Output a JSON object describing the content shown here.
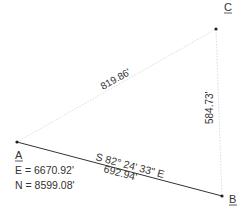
{
  "diagram": {
    "points": [
      {
        "id": "A",
        "label": "A",
        "x": 17,
        "y": 142
      },
      {
        "id": "B",
        "label": "B",
        "x": 222,
        "y": 196
      },
      {
        "id": "C",
        "label": "C",
        "x": 216,
        "y": 29
      }
    ],
    "point_a_coords": {
      "easting": "E = 6670.92'",
      "northing": "N = 8599.08'"
    },
    "lines": {
      "ab": {
        "bearing": "S 82° 24' 33\" E",
        "distance": "692.94'",
        "style": "solid"
      },
      "ac": {
        "distance": "819.86'",
        "style": "dotted"
      },
      "cb": {
        "distance": "584.73'",
        "style": "dotted"
      }
    },
    "colors": {
      "solid_line": "#333333",
      "dotted_line": "#d9d9d9",
      "text": "#333333"
    }
  }
}
